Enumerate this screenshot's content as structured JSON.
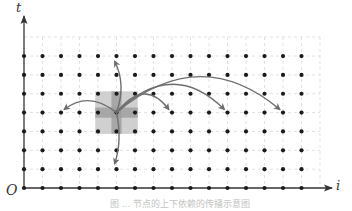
{
  "figure": {
    "axis_x_label": "i",
    "axis_y_label": "t",
    "origin_label": "O",
    "caption": "图 ... 节点的上下依赖的传播示意图"
  },
  "grid": {
    "columns": 16,
    "rows": 8,
    "x0": 24,
    "dx": 18.5,
    "y0": 188,
    "dy": 18.85,
    "dashed_right": 320,
    "dashed_top": 37,
    "dot_color": "#1a1a1a",
    "grid_color": "#d9d9d9",
    "axis_color": "#333333"
  },
  "highlight": {
    "center_col": 5,
    "center_row": 4,
    "outer_square_color": "#c8c8c8",
    "cross_color": "#9a9a9a"
  },
  "arrows": [
    {
      "name": "arrow-up",
      "from": [
        5,
        4
      ],
      "to": [
        5,
        7
      ],
      "color": "#6e6e6e"
    },
    {
      "name": "arrow-down",
      "from": [
        5,
        4
      ],
      "to": [
        5,
        1
      ],
      "color": "#6e6e6e"
    },
    {
      "name": "arrow-left",
      "from": [
        5,
        4
      ],
      "to": [
        2,
        4
      ],
      "color": "#6e6e6e"
    },
    {
      "name": "arrow-right-near",
      "from": [
        5,
        4
      ],
      "to": [
        8,
        4
      ],
      "color": "#6e6e6e"
    },
    {
      "name": "arrow-right-mid",
      "from": [
        5,
        4
      ],
      "to": [
        11,
        4
      ],
      "color": "#6e6e6e"
    },
    {
      "name": "arrow-right-far",
      "from": [
        5,
        4
      ],
      "to": [
        14,
        4
      ],
      "color": "#6e6e6e"
    }
  ]
}
